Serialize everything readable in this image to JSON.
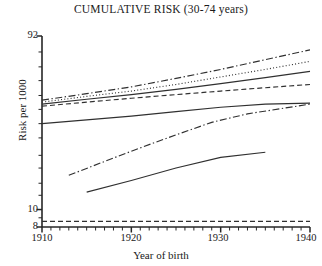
{
  "chart": {
    "title": "CUMULATIVE RISK (30-74 years)",
    "xlabel": "Year of birth",
    "ylabel": "Risk per 1000"
  },
  "axes": {
    "y_ticks": [
      {
        "value": 92,
        "label": "92"
      },
      {
        "value": 10,
        "label": "10"
      },
      {
        "value": 8,
        "label": "8"
      }
    ],
    "x_ticks": [
      {
        "value": 1910,
        "label": "1910"
      },
      {
        "value": 1920,
        "label": "1920"
      },
      {
        "value": 1930,
        "label": "1930"
      },
      {
        "value": 1940,
        "label": "1940"
      }
    ]
  },
  "chart_data": {
    "type": "line",
    "title": "CUMULATIVE RISK (30-74 years)",
    "xlabel": "Year of birth",
    "ylabel": "Risk per 1000",
    "xlim": [
      1910,
      1940
    ],
    "ylim": [
      8,
      92
    ],
    "yscale": "log",
    "grid": false,
    "legend": "none",
    "x_ticks": [
      1910,
      1920,
      1930,
      1940
    ],
    "x_minor_tick_step": 1,
    "y_ticks": [
      8,
      10,
      92
    ],
    "series": [
      {
        "name": "series-1",
        "style": "dash-dot",
        "x": [
          1910,
          1915,
          1920,
          1925,
          1930,
          1935,
          1940
        ],
        "values": [
          40.5,
          44.0,
          48.0,
          53.5,
          60.0,
          68.0,
          77.0
        ]
      },
      {
        "name": "series-2",
        "style": "dotted",
        "x": [
          1910,
          1915,
          1920,
          1925,
          1930,
          1935,
          1940
        ],
        "values": [
          39.5,
          42.5,
          45.5,
          49.5,
          54.5,
          60.0,
          66.5
        ]
      },
      {
        "name": "series-3",
        "style": "solid",
        "x": [
          1910,
          1915,
          1920,
          1925,
          1930,
          1935,
          1940
        ],
        "values": [
          38.5,
          41.0,
          43.5,
          46.5,
          50.0,
          54.0,
          58.5
        ]
      },
      {
        "name": "series-4",
        "style": "dashed",
        "x": [
          1910,
          1915,
          1920,
          1925,
          1930,
          1935,
          1940
        ],
        "values": [
          37.5,
          39.5,
          41.5,
          43.5,
          45.5,
          47.5,
          49.5
        ]
      },
      {
        "name": "series-5",
        "style": "solid",
        "x": [
          1910,
          1915,
          1920,
          1925,
          1930,
          1935,
          1940
        ],
        "values": [
          30.0,
          31.5,
          33.0,
          35.0,
          37.0,
          38.5,
          39.0
        ]
      },
      {
        "name": "series-6",
        "style": "dash-dot",
        "x": [
          1913,
          1917,
          1921,
          1925,
          1929,
          1933,
          1937,
          1940
        ],
        "values": [
          15.5,
          18.5,
          22.0,
          26.0,
          30.5,
          34.0,
          36.5,
          38.5
        ]
      },
      {
        "name": "series-7",
        "style": "solid",
        "x": [
          1915,
          1920,
          1925,
          1930,
          1935
        ],
        "values": [
          12.5,
          14.5,
          17.0,
          19.5,
          20.8
        ]
      },
      {
        "name": "reference-line",
        "style": "dashed",
        "x": [
          1910,
          1940
        ],
        "values": [
          8.6,
          8.6
        ]
      }
    ]
  }
}
